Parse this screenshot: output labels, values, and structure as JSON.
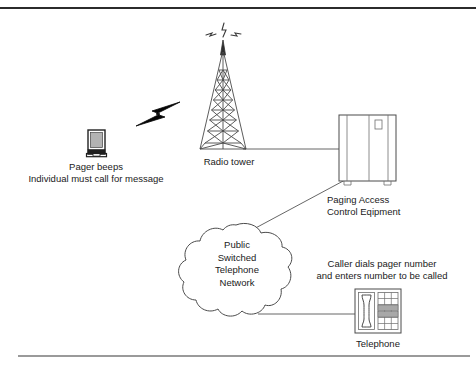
{
  "figure": {
    "background_color": "#ffffff",
    "stroke_color": "#333333",
    "top_rule_color": "#2b2b2b",
    "bottom_rule_color": "#9a9a9a"
  },
  "nodes": {
    "pager": {
      "icon": "pager-device-icon",
      "caption_line1": "Pager beeps",
      "caption_line2": "Individual must call for message"
    },
    "signal": {
      "icon": "lightning-bolt-icon",
      "label": "radio signal"
    },
    "tower": {
      "icon": "radio-tower-icon",
      "caption": "Radio tower",
      "antenna_waves": "radio-waves-icon"
    },
    "equipment": {
      "icon": "equipment-cabinet-icon",
      "caption_line1": "Paging Access",
      "caption_line2": "Control Eqipment"
    },
    "cloud": {
      "icon": "network-cloud-icon",
      "line1": "Public",
      "line2": "Switched",
      "line3": "Telephone",
      "line4": "Network"
    },
    "telephone": {
      "icon": "telephone-icon",
      "caption": "Telephone",
      "note_line1": "Caller dials pager number",
      "note_line2": "and enters number to be called"
    }
  },
  "connectors": [
    {
      "name": "tower-to-equipment",
      "from": "tower",
      "to": "equipment"
    },
    {
      "name": "equipment-to-cloud",
      "from": "equipment",
      "to": "cloud"
    },
    {
      "name": "cloud-to-telephone",
      "from": "cloud",
      "to": "telephone"
    },
    {
      "name": "tower-to-pager-wireless",
      "from": "tower",
      "to": "pager"
    }
  ]
}
